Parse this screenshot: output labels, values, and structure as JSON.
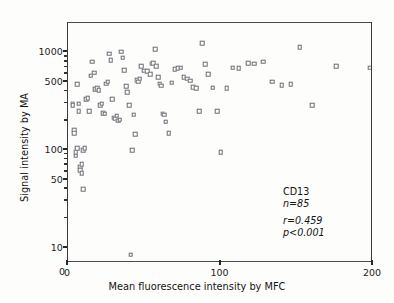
{
  "chart_data": {
    "type": "scatter",
    "title": "",
    "xlabel": "Mean fluorescence intensity by MFC",
    "ylabel": "Signal intensity by MA",
    "xlim": [
      0,
      200
    ],
    "ylim": [
      7,
      2000
    ],
    "yscale": "log",
    "xscale": "linear",
    "grid": false,
    "legend": "none",
    "xticks": [
      {
        "value": 0,
        "label": "0"
      },
      {
        "value": 100,
        "label": "100"
      },
      {
        "value": 200,
        "label": "200"
      }
    ],
    "yticks_major": [
      {
        "value": 10,
        "label": "10"
      },
      {
        "value": 50,
        "label": "50"
      },
      {
        "value": 100,
        "label": "100"
      },
      {
        "value": 500,
        "label": "500"
      },
      {
        "value": 1000,
        "label": "1000"
      }
    ],
    "yticks_minor": [
      20,
      30,
      40,
      60,
      70,
      80,
      90,
      200,
      300,
      400,
      600,
      700,
      800,
      900
    ],
    "marker": "open-square",
    "marker_color": "#6b6b72",
    "annotations": {
      "marker_label": "CD13",
      "sample_size": "n=85",
      "correlation": "r=0.459",
      "pvalue": "p<0.001"
    },
    "points": [
      [
        3,
        300
      ],
      [
        3,
        290
      ],
      [
        4,
        160
      ],
      [
        4,
        150
      ],
      [
        5,
        95
      ],
      [
        5,
        88
      ],
      [
        6,
        105
      ],
      [
        6,
        470
      ],
      [
        7,
        300
      ],
      [
        7,
        250
      ],
      [
        8,
        68
      ],
      [
        8,
        62
      ],
      [
        9,
        72
      ],
      [
        9,
        58
      ],
      [
        10,
        40
      ],
      [
        10,
        100
      ],
      [
        11,
        105
      ],
      [
        12,
        330
      ],
      [
        13,
        340
      ],
      [
        14,
        250
      ],
      [
        15,
        580
      ],
      [
        16,
        800
      ],
      [
        17,
        620
      ],
      [
        18,
        420
      ],
      [
        19,
        430
      ],
      [
        20,
        410
      ],
      [
        21,
        290
      ],
      [
        22,
        300
      ],
      [
        23,
        240
      ],
      [
        24,
        235
      ],
      [
        25,
        480
      ],
      [
        26,
        500
      ],
      [
        27,
        970
      ],
      [
        28,
        830
      ],
      [
        29,
        330
      ],
      [
        30,
        215
      ],
      [
        31,
        210
      ],
      [
        32,
        225
      ],
      [
        33,
        200
      ],
      [
        34,
        205
      ],
      [
        35,
        1020
      ],
      [
        36,
        880
      ],
      [
        37,
        660
      ],
      [
        38,
        450
      ],
      [
        39,
        390
      ],
      [
        40,
        290
      ],
      [
        41,
        8.5
      ],
      [
        42,
        100
      ],
      [
        43,
        230
      ],
      [
        44,
        145
      ],
      [
        45,
        520
      ],
      [
        46,
        500
      ],
      [
        47,
        540
      ],
      [
        48,
        720
      ],
      [
        50,
        650
      ],
      [
        52,
        640
      ],
      [
        54,
        600
      ],
      [
        55,
        770
      ],
      [
        56,
        780
      ],
      [
        57,
        1080
      ],
      [
        58,
        720
      ],
      [
        59,
        560
      ],
      [
        60,
        480
      ],
      [
        61,
        455
      ],
      [
        62,
        235
      ],
      [
        63,
        230
      ],
      [
        64,
        195
      ],
      [
        66,
        150
      ],
      [
        68,
        490
      ],
      [
        70,
        670
      ],
      [
        72,
        690
      ],
      [
        74,
        700
      ],
      [
        76,
        560
      ],
      [
        78,
        540
      ],
      [
        80,
        515
      ],
      [
        82,
        440
      ],
      [
        84,
        430
      ],
      [
        86,
        250
      ],
      [
        88,
        1250
      ],
      [
        90,
        760
      ],
      [
        92,
        600
      ],
      [
        95,
        435
      ],
      [
        98,
        250
      ],
      [
        100,
        95
      ],
      [
        104,
        430
      ],
      [
        108,
        700
      ],
      [
        112,
        690
      ],
      [
        118,
        780
      ],
      [
        122,
        770
      ],
      [
        128,
        800
      ],
      [
        134,
        500
      ],
      [
        140,
        460
      ],
      [
        146,
        470
      ],
      [
        152,
        1130
      ],
      [
        160,
        290
      ],
      [
        176,
        720
      ],
      [
        198,
        700
      ]
    ]
  },
  "axes": {
    "y_title": "Signal intensity by MA",
    "x_title": "Mean fluorescence intensity by MFC",
    "origin_label": "0"
  }
}
